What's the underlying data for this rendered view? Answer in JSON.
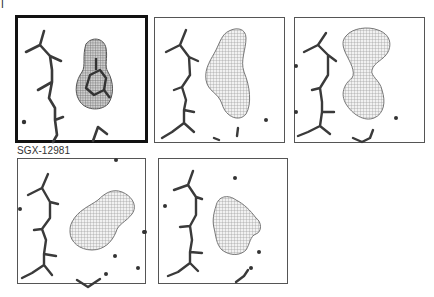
{
  "figure": {
    "panel_label": "I",
    "caption": "SGX-12981",
    "panels": [
      {
        "id": "p1",
        "row": 1,
        "col": 1,
        "selected": true,
        "density": "ligand-with-ring"
      },
      {
        "id": "p2",
        "row": 1,
        "col": 2,
        "selected": false,
        "density": "elongated-blob"
      },
      {
        "id": "p3",
        "row": 1,
        "col": 3,
        "selected": false,
        "density": "large-irregular-blob"
      },
      {
        "id": "p4",
        "row": 2,
        "col": 1,
        "selected": false,
        "density": "rounded-blob"
      },
      {
        "id": "p5",
        "row": 2,
        "col": 2,
        "selected": false,
        "density": "small-irregular-blob"
      }
    ],
    "colors": {
      "stick": "#333333",
      "mesh": "#888888",
      "border_selected": "#111111",
      "border_normal": "#555555"
    }
  }
}
